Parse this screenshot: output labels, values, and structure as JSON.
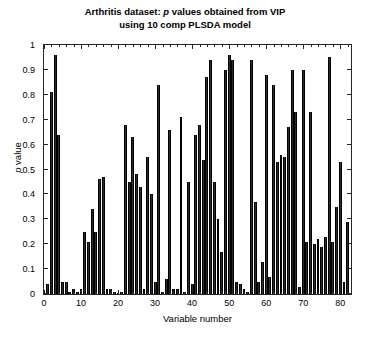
{
  "chart_data": {
    "type": "bar",
    "title_line1_pre": "Arthritis dataset: ",
    "title_line1_ital": "p",
    "title_line1_post": " values obtained from VIP",
    "title_line2": "using 10 comp PLSDA model",
    "title": "Arthritis dataset: p values obtained from VIP using 10 comp PLSDA model",
    "xlabel": "Variable number",
    "ylabel_ital": "p",
    "ylabel_post": " value",
    "ylabel": "p value",
    "xlim": [
      0,
      82.9
    ],
    "ylim": [
      0,
      1
    ],
    "grid": false,
    "legend": "none",
    "bar_color": "#2b2b2b",
    "x_ticks": [
      0,
      10,
      20,
      30,
      40,
      50,
      60,
      70,
      80
    ],
    "x_tick_labels": [
      "0",
      "10",
      "20",
      "30",
      "40",
      "50",
      "60",
      "70",
      "80"
    ],
    "y_ticks": [
      0,
      0.1,
      0.2,
      0.3,
      0.4,
      0.5,
      0.6,
      0.7,
      0.8,
      0.9,
      1
    ],
    "y_tick_labels": [
      "0",
      "0.1",
      "0.2",
      "0.3",
      "0.4",
      "0.5",
      "0.6",
      "0.7",
      "0.8",
      "0.9",
      "1"
    ],
    "categories": [
      1,
      2,
      3,
      4,
      5,
      6,
      7,
      8,
      9,
      10,
      11,
      12,
      13,
      14,
      15,
      16,
      17,
      18,
      19,
      20,
      21,
      22,
      23,
      24,
      25,
      26,
      27,
      28,
      29,
      30,
      31,
      32,
      33,
      34,
      35,
      36,
      37,
      38,
      39,
      40,
      41,
      42,
      43,
      44,
      45,
      46,
      47,
      48,
      49,
      50,
      51,
      52,
      53,
      54,
      55,
      56,
      57,
      58,
      59,
      60,
      61,
      62,
      63,
      64,
      65,
      66,
      67,
      68,
      69,
      70,
      71,
      72,
      73,
      74,
      75,
      76,
      77,
      78,
      79,
      80,
      81,
      82
    ],
    "values": [
      0.04,
      0.81,
      0.96,
      0.64,
      0.05,
      0.05,
      0.01,
      0.02,
      0.01,
      0.02,
      0.25,
      0.21,
      0.34,
      0.25,
      0.46,
      0.47,
      0.02,
      0.02,
      0.01,
      0.0,
      0.01,
      0.68,
      0.45,
      0.63,
      0.48,
      0.43,
      0.02,
      0.55,
      0.4,
      0.05,
      0.84,
      0.01,
      0.06,
      0.66,
      0.02,
      0.02,
      0.71,
      0.01,
      0.45,
      0.04,
      0.64,
      0.68,
      0.54,
      0.87,
      0.94,
      0.45,
      0.3,
      0.17,
      0.9,
      0.96,
      0.94,
      0.05,
      0.04,
      0.02,
      0.01,
      0.94,
      0.37,
      0.05,
      0.13,
      0.88,
      0.07,
      0.84,
      0.53,
      0.56,
      0.55,
      0.67,
      0.9,
      0.73,
      0.03,
      0.9,
      0.21,
      0.73,
      0.2,
      0.22,
      0.19,
      0.23,
      0.95,
      0.21,
      0.35,
      0.53,
      0.05,
      0.29
    ]
  }
}
